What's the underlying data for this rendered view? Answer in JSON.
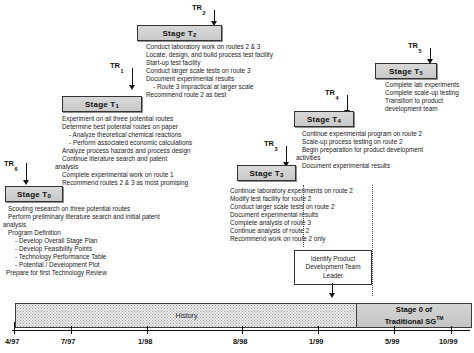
{
  "diagram": {
    "stages": [
      {
        "id": "stage-t0",
        "label": "Stage T",
        "subscript": "0",
        "tasks": [
          "Scouting research on three potential routes",
          "Perform preliminary literature search and initial patent",
          "analysis",
          "Program Definition",
          "-  Develop Overall Stage Plan",
          "-  Develop Feasibility Points",
          "-  Technology Performance Table",
          "-  Potential / Development Plot",
          "Prepare for first Technology Review"
        ]
      },
      {
        "id": "stage-t1",
        "label": "Stage T",
        "subscript": "1",
        "tasks": [
          "Experiment on all three potential routes",
          "Determine best potential routes on paper",
          "-  Analyze theoretical chemical reactions",
          "-  Perform associated economic calculations",
          "Analyze process hazards and process design",
          "Continue literature search and patent",
          "analysis",
          "Complete experimental work on route 1",
          "Recommend routes 2 & 3 as most promising"
        ]
      },
      {
        "id": "stage-t2",
        "label": "Stage T",
        "subscript": "2",
        "tasks": [
          "Conduct laboratory work on routes 2 & 3",
          "Locate, design, and build process test facility",
          "Start-up test facility",
          "Conduct larger scale tests on route 3",
          "Document experimental results",
          "-  Route 3 impractical at larger scale",
          "Recommend route 2 as best"
        ]
      },
      {
        "id": "stage-t3",
        "label": "Stage T",
        "subscript": "3",
        "tasks": [
          "Continue laboratory experiments on route 2",
          "Modify test facility for route 2",
          "Conduct larger scale tests on route 2",
          "Document experimental results",
          "Complete analysis of route 3",
          "Continue analysis of route 2",
          "Recommend work on route 2 only"
        ]
      },
      {
        "id": "stage-t4",
        "label": "Stage T",
        "subscript": "4",
        "tasks": [
          "Continue experimental program on route 2",
          "Scale-up process testing on route 2",
          "Begin preparation for product development",
          "activities",
          "Document experimental results"
        ]
      },
      {
        "id": "stage-t5",
        "label": "Stage T",
        "subscript": "5",
        "tasks": [
          "Complete lab experiments",
          "Complete scale-up testing",
          "Transition to product",
          "development team"
        ]
      }
    ],
    "reviews": [
      {
        "id": "tr-1",
        "label": "TR",
        "subscript": "1"
      },
      {
        "id": "tr-2",
        "label": "TR",
        "subscript": "2"
      },
      {
        "id": "tr-3",
        "label": "TR",
        "subscript": "3"
      },
      {
        "id": "tr-4",
        "label": "TR",
        "subscript": "4"
      },
      {
        "id": "tr-5",
        "label": "TR",
        "subscript": "5"
      },
      {
        "id": "tr-6",
        "label": "TR",
        "subscript": "6"
      }
    ],
    "product_dev_box": {
      "line1": "Identify Product",
      "line2": "Development Team",
      "line3": "Leader"
    },
    "timeline": {
      "history_label": "History",
      "sg_line1": "Stage 0 of",
      "sg_line2": "Traditional SG",
      "sg_trademark": "TM",
      "ticks": [
        "4/97",
        "7/97",
        "1/98",
        "8/98",
        "1/99",
        "5/99",
        "10/99"
      ]
    }
  }
}
